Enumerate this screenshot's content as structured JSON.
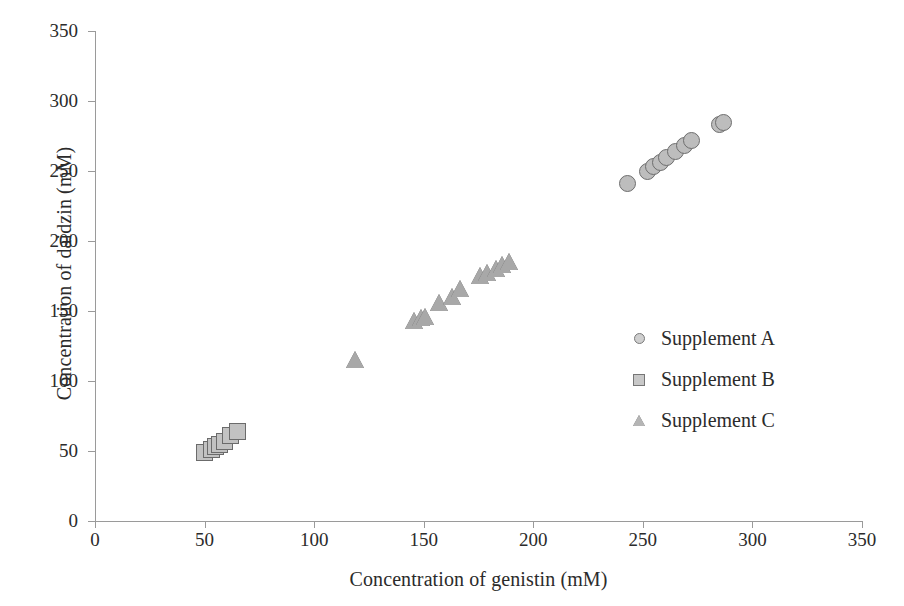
{
  "chart_data": {
    "type": "scatter",
    "title": "",
    "xlabel": "Concentration of genistin (mM)",
    "ylabel": "Concentration of daidzin (mM)",
    "xlim": [
      0,
      350
    ],
    "ylim": [
      0,
      350
    ],
    "xticks": [
      0,
      50,
      100,
      150,
      200,
      250,
      300,
      350
    ],
    "yticks": [
      0,
      50,
      100,
      150,
      200,
      250,
      300,
      350
    ],
    "grid": false,
    "legend_position": "center-right",
    "series": [
      {
        "name": "Supplement A",
        "marker": "circle",
        "color": "#bdbdbd",
        "edge_color": "#6e6e6e",
        "points": [
          [
            243,
            241
          ],
          [
            252,
            250
          ],
          [
            255,
            253
          ],
          [
            258,
            256
          ],
          [
            261,
            260
          ],
          [
            265,
            264
          ],
          [
            269,
            268
          ],
          [
            272,
            272
          ],
          [
            285,
            283
          ],
          [
            287,
            285
          ]
        ]
      },
      {
        "name": "Supplement B",
        "marker": "square",
        "color": "#c2c2c2",
        "edge_color": "#6b6b6b",
        "points": [
          [
            50,
            49
          ],
          [
            53,
            51
          ],
          [
            55,
            53
          ],
          [
            57,
            55
          ],
          [
            59,
            57
          ],
          [
            62,
            61
          ],
          [
            65,
            64
          ]
        ]
      },
      {
        "name": "Supplement C",
        "marker": "triangle",
        "color": "#a8a8a8",
        "edge_color": "#5d5d5d",
        "points": [
          [
            119,
            115
          ],
          [
            146,
            143
          ],
          [
            149,
            145
          ],
          [
            151,
            146
          ],
          [
            157,
            156
          ],
          [
            163,
            160
          ],
          [
            167,
            166
          ],
          [
            176,
            175
          ],
          [
            179,
            177
          ],
          [
            183,
            180
          ],
          [
            186,
            183
          ],
          [
            189,
            185
          ]
        ]
      }
    ]
  },
  "axes": {
    "y_title": "Concentration of daidzin (mM)",
    "x_title": "Concentration of genistin (mM)",
    "y_tick_labels": [
      "0",
      "50",
      "100",
      "150",
      "200",
      "250",
      "300",
      "350"
    ],
    "x_tick_labels": [
      "0",
      "50",
      "100",
      "150",
      "200",
      "250",
      "300",
      "350"
    ],
    "axis_color": "#9a9a9a"
  },
  "legend": {
    "entries": [
      {
        "label": "Supplement A",
        "marker": "circle-marker-icon"
      },
      {
        "label": "Supplement B",
        "marker": "square-marker-icon"
      },
      {
        "label": "Supplement C",
        "marker": "triangle-marker-icon"
      }
    ]
  }
}
